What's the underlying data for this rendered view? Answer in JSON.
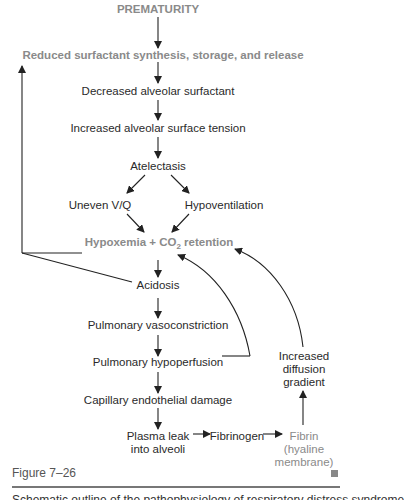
{
  "diagram": {
    "nodes": {
      "prematurity": "PREMATURITY",
      "reduced_surfactant": "Reduced surfactant synthesis, storage, and release",
      "decreased_surfactant": "Decreased alveolar surfactant",
      "surface_tension": "Increased alveolar surface tension",
      "atelectasis": "Atelectasis",
      "uneven_vq": "Uneven V/Q",
      "hypoventilation": "Hypoventilation",
      "hypoxemia_prefix": "Hypoxemia + CO",
      "hypoxemia_sub": "2",
      "hypoxemia_suffix": " retention",
      "acidosis": "Acidosis",
      "vasoconstriction": "Pulmonary vasoconstriction",
      "hypoperfusion": "Pulmonary hypoperfusion",
      "capillary_damage": "Capillary endothelial damage",
      "plasma_leak_line1": "Plasma leak",
      "plasma_leak_line2": "into alveoli",
      "fibrinogen": "Fibrinogen",
      "fibrin_line1": "Fibrin",
      "fibrin_line2": "(hyaline",
      "fibrin_line3": "membrane)",
      "diffusion_line1": "Increased",
      "diffusion_line2": "diffusion",
      "diffusion_line3": "gradient"
    },
    "colors": {
      "highlight": "#8a8a8a",
      "text": "#2a2a2a",
      "arrow": "#222222"
    }
  },
  "caption": {
    "label": "Figure 7–26",
    "truncated_text": "Schematic outline of the pathophysiology of respiratory distress syndrome"
  }
}
